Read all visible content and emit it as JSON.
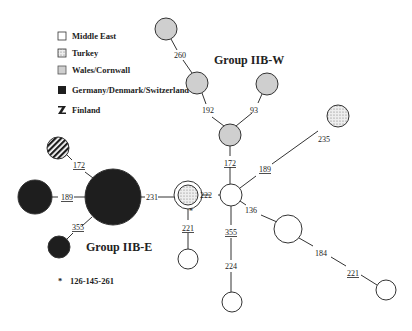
{
  "legend": {
    "items": [
      {
        "label": "Middle East",
        "fill": "#ffffff",
        "pattern": "none"
      },
      {
        "label": "Turkey",
        "fill": "#e6e6e6",
        "pattern": "dots"
      },
      {
        "label": "Wales/Cornwall",
        "fill": "#cfcfcf",
        "pattern": "none"
      },
      {
        "label": "Germany/Denmark/Switzerland",
        "fill": "#1e1e1e",
        "pattern": "none"
      },
      {
        "label": "Finland",
        "fill": "#1e1e1e",
        "pattern": "stripes"
      }
    ]
  },
  "groups": {
    "iib_w": "Group IIB-W",
    "iib_e": "Group IIB-E"
  },
  "footnote": {
    "marker": "*",
    "text": "126-145-261"
  },
  "nodes": [
    {
      "id": "w1",
      "cx": 166,
      "cy": 29,
      "r": 11,
      "region": "Wales/Cornwall"
    },
    {
      "id": "w2",
      "cx": 197,
      "cy": 83,
      "r": 11,
      "region": "Wales/Cornwall"
    },
    {
      "id": "w3",
      "cx": 267,
      "cy": 84,
      "r": 11,
      "region": "Wales/Cornwall"
    },
    {
      "id": "w4",
      "cx": 230,
      "cy": 135,
      "r": 11,
      "region": "Wales/Cornwall"
    },
    {
      "id": "hub",
      "cx": 231,
      "cy": 195,
      "r": 11,
      "region": "Middle East"
    },
    {
      "id": "t1",
      "cx": 188,
      "cy": 195,
      "r": 14,
      "region": "Turkey/Middle East"
    },
    {
      "id": "t2",
      "cx": 338,
      "cy": 116,
      "r": 11,
      "region": "Turkey"
    },
    {
      "id": "m1",
      "cx": 288,
      "cy": 229,
      "r": 14,
      "region": "Middle East"
    },
    {
      "id": "m2",
      "cx": 386,
      "cy": 290,
      "r": 10,
      "region": "Middle East"
    },
    {
      "id": "m3",
      "cx": 232,
      "cy": 302,
      "r": 10,
      "region": "Middle East"
    },
    {
      "id": "m4",
      "cx": 188,
      "cy": 259,
      "r": 10,
      "region": "Middle East"
    },
    {
      "id": "g1",
      "cx": 113,
      "cy": 197,
      "r": 28,
      "region": "Germany/Denmark/Switzerland"
    },
    {
      "id": "g2",
      "cx": 35,
      "cy": 197,
      "r": 17,
      "region": "Germany/Denmark/Switzerland"
    },
    {
      "id": "g3",
      "cx": 59,
      "cy": 247,
      "r": 11,
      "region": "Germany/Denmark/Switzerland"
    },
    {
      "id": "f1",
      "cx": 58,
      "cy": 148,
      "r": 11,
      "region": "Finland"
    }
  ],
  "edges": [
    {
      "from": "w1",
      "to": "w2",
      "labels": [
        "260"
      ]
    },
    {
      "from": "w2",
      "to": "w4",
      "labels": [
        "192"
      ]
    },
    {
      "from": "w3",
      "to": "w4",
      "labels": [
        "93"
      ]
    },
    {
      "from": "w4",
      "to": "hub",
      "labels": [
        "172"
      ],
      "underlined": true
    },
    {
      "from": "hub",
      "to": "t2",
      "labels": [
        "189",
        "235"
      ]
    },
    {
      "from": "t1",
      "to": "hub",
      "labels": [
        "222"
      ]
    },
    {
      "from": "hub",
      "to": "m1",
      "labels": [
        "136"
      ]
    },
    {
      "from": "m1",
      "to": "m2",
      "labels": [
        "184",
        "221"
      ]
    },
    {
      "from": "hub",
      "to": "m3",
      "labels": [
        "355",
        "224"
      ]
    },
    {
      "from": "t1",
      "to": "m4",
      "labels": [
        "221"
      ],
      "underlined": true
    },
    {
      "from": "g1",
      "to": "t1",
      "labels": [
        "231"
      ]
    },
    {
      "from": "g1",
      "to": "f1",
      "labels": [
        "172"
      ],
      "underlined": true
    },
    {
      "from": "g1",
      "to": "g2",
      "labels": [
        "189"
      ],
      "underlined": true
    },
    {
      "from": "g1",
      "to": "g3",
      "labels": [
        "355"
      ],
      "underlined": true
    }
  ],
  "edge_labels": {
    "e260": "260",
    "e192": "192",
    "e93": "93",
    "e172a": "172",
    "e189a": "189",
    "e235": "235",
    "e222": "222",
    "e136": "136",
    "e184": "184",
    "e221a": "221",
    "e355a": "355",
    "e224": "224",
    "e221b": "221",
    "e231": "231",
    "e172b": "172",
    "e189b": "189",
    "e355b": "355",
    "star": "*"
  }
}
